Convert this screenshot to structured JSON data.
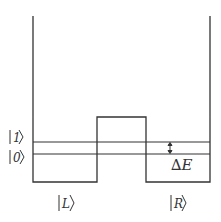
{
  "diagram": {
    "type": "double-well-potential",
    "stroke_color": "#333333",
    "background": "#ffffff",
    "state_labels": {
      "excited": "1",
      "ground": "0",
      "left": "L",
      "right": "R"
    },
    "energy_gap_label": "∆E",
    "geometry": {
      "left_wall_x": 33,
      "right_wall_x": 210,
      "wall_top_y": 16,
      "floor_y": 182,
      "barrier_left_x": 97,
      "barrier_right_x": 146,
      "barrier_top_y": 117,
      "level1_y": 142,
      "level0_y": 154
    }
  }
}
